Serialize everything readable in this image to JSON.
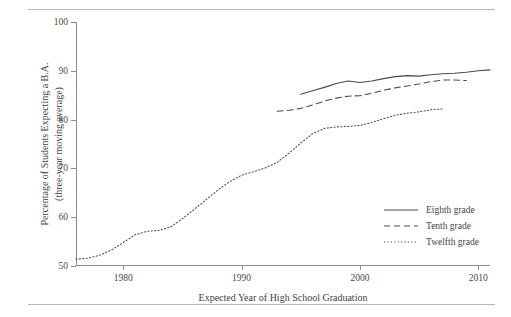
{
  "figure": {
    "top_rule": true,
    "bottom_rule": true,
    "cropped_title_fragment": ""
  },
  "axes": {
    "y_tick_labels": [
      "100",
      "90",
      "80",
      "70",
      "60",
      "50"
    ],
    "x_tick_labels": [
      "1980",
      "1990",
      "2000",
      "2010"
    ],
    "x_title": "Expected Year of High School Graduation",
    "y_title_line1": "Percentage of Students Expecting a B.A.",
    "y_title_line2": "(three-year moving average)"
  },
  "legend": {
    "position": "inside-lower-right",
    "entries": [
      {
        "label": "Eighth grade",
        "style": "solid"
      },
      {
        "label": "Tenth grade",
        "style": "dashed"
      },
      {
        "label": "Twelfth grade",
        "style": "dotted"
      }
    ]
  },
  "colors": {
    "line": "#4a4a4a",
    "axis": "#8d8d8d",
    "rule": "#b9b9b9",
    "text": "#3f3f3f"
  },
  "chart_data": {
    "type": "line",
    "title": "",
    "xlabel": "Expected Year of High School Graduation",
    "ylabel": "Percentage of Students Expecting a B.A. (three-year moving average)",
    "xlim": [
      1976,
      2011
    ],
    "ylim": [
      50,
      100
    ],
    "y_ticks": [
      50,
      60,
      70,
      80,
      90,
      100
    ],
    "x_ticks": [
      1980,
      1990,
      2000,
      2010
    ],
    "grid": false,
    "legend_position": "lower right inside axes",
    "series": [
      {
        "name": "Eighth grade",
        "style": "solid",
        "x": [
          1995,
          1996,
          1997,
          1998,
          1999,
          2000,
          2001,
          2002,
          2003,
          2004,
          2005,
          2006,
          2007,
          2008,
          2009,
          2010,
          2011
        ],
        "values": [
          85.2,
          85.9,
          86.6,
          87.4,
          87.9,
          87.6,
          87.9,
          88.4,
          88.8,
          89.0,
          88.9,
          89.2,
          89.4,
          89.5,
          89.7,
          90.0,
          90.2
        ]
      },
      {
        "name": "Tenth grade",
        "style": "dashed",
        "x": [
          1993,
          1994,
          1995,
          1996,
          1997,
          1998,
          1999,
          2000,
          2001,
          2002,
          2003,
          2004,
          2005,
          2006,
          2007,
          2008,
          2009
        ],
        "values": [
          81.7,
          81.9,
          82.3,
          83.0,
          83.8,
          84.4,
          84.8,
          84.9,
          85.4,
          86.0,
          86.5,
          86.9,
          87.3,
          87.8,
          88.1,
          88.1,
          88.0
        ]
      },
      {
        "name": "Twelfth grade",
        "style": "dotted",
        "x": [
          1976,
          1977,
          1978,
          1979,
          1980,
          1981,
          1982,
          1983,
          1984,
          1985,
          1986,
          1987,
          1988,
          1989,
          1990,
          1991,
          1992,
          1993,
          1994,
          1995,
          1996,
          1997,
          1998,
          1999,
          2000,
          2001,
          2002,
          2003,
          2004,
          2005,
          2006,
          2007
        ],
        "values": [
          51.4,
          51.6,
          52.2,
          53.3,
          54.8,
          56.4,
          57.1,
          57.3,
          58.0,
          59.7,
          61.6,
          63.6,
          65.6,
          67.3,
          68.6,
          69.3,
          70.1,
          71.2,
          73.1,
          75.2,
          77.1,
          78.2,
          78.5,
          78.6,
          78.8,
          79.4,
          80.2,
          80.9,
          81.3,
          81.6,
          82.0,
          82.2
        ]
      }
    ]
  }
}
